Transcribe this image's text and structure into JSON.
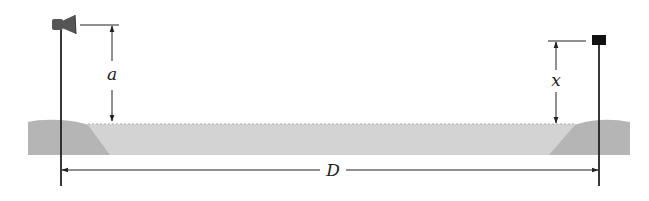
{
  "diagram": {
    "labels": {
      "a": "a",
      "x": "x",
      "D": "D"
    },
    "elements": {
      "source": "speaker-icon",
      "receiver": "receiver-icon"
    },
    "colors": {
      "ground_light": "#cfcfcf",
      "ground_dark": "#b3b3b3",
      "line": "#222222",
      "speaker": "#555555",
      "receiver": "#111111"
    }
  }
}
